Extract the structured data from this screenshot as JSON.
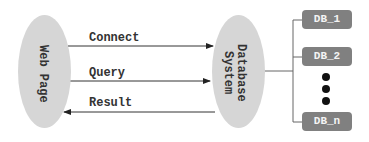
{
  "diagram": {
    "nodes": {
      "web_page": {
        "label": "Web Page"
      },
      "database_system": {
        "label_line1": "Database",
        "label_line2": "System"
      }
    },
    "messages": [
      {
        "label": "Connect",
        "from": "web_page",
        "to": "database_system"
      },
      {
        "label": "Query",
        "from": "web_page",
        "to": "database_system"
      },
      {
        "label": "Result",
        "from": "database_system",
        "to": "web_page"
      }
    ],
    "databases": [
      {
        "label": "DB_1"
      },
      {
        "label": "DB_2"
      },
      {
        "label": "DB_n"
      }
    ],
    "ellipsis": "⋮",
    "colors": {
      "ellipse": "#d6d6d6",
      "db_box": "#808080",
      "line": "#333333"
    }
  }
}
